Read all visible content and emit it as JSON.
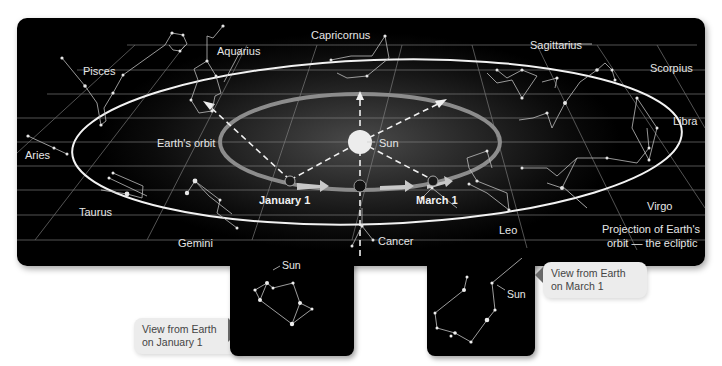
{
  "diagram": {
    "type": "astronomy-ecliptic",
    "main_panel": {
      "background": "#000000",
      "center_object": {
        "label": "Sun",
        "color": "#e8e8e8"
      },
      "orbit_label": "Earth's orbit",
      "orbit_color": "#7a7a7a",
      "ecliptic_color": "#ffffff",
      "earth_positions": [
        {
          "label": "January 1"
        },
        {
          "label": "March 1"
        }
      ],
      "ecliptic_label_line1": "Projection of Earth's",
      "ecliptic_label_line2": "orbit — the ecliptic",
      "constellations": [
        {
          "name": "Capricornus"
        },
        {
          "name": "Aquarius"
        },
        {
          "name": "Pisces"
        },
        {
          "name": "Aries"
        },
        {
          "name": "Taurus"
        },
        {
          "name": "Gemini"
        },
        {
          "name": "Cancer"
        },
        {
          "name": "Leo"
        },
        {
          "name": "Virgo"
        },
        {
          "name": "Libra"
        },
        {
          "name": "Scorpius"
        },
        {
          "name": "Sagittarius"
        }
      ]
    },
    "insets": [
      {
        "callout_line1": "View from Earth",
        "callout_line2": "on January 1",
        "sun_label": "Sun"
      },
      {
        "callout_line1": "View from Earth",
        "callout_line2": "on March 1",
        "sun_label": "Sun"
      }
    ]
  }
}
